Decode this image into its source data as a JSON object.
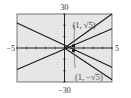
{
  "chart_data": {
    "type": "line",
    "title": "",
    "xlabel": "",
    "ylabel": "",
    "xlim": [
      -5,
      5
    ],
    "ylim": [
      -30,
      30
    ],
    "grid": false,
    "x_ticks_count": 10,
    "y_ticks_count": 6,
    "tick_labels": {
      "x_min": "−5",
      "x_max": "5",
      "y_max": "30",
      "y_min": "−30"
    },
    "series": [
      {
        "name": "line-1",
        "x": [
          -5,
          5
        ],
        "y": [
          22,
          -17
        ]
      },
      {
        "name": "line-2",
        "x": [
          -5,
          5
        ],
        "y": [
          -19,
          17
        ]
      },
      {
        "name": "line-3",
        "x": [
          0,
          5
        ],
        "y": [
          0,
          30
        ]
      },
      {
        "name": "line-4",
        "x": [
          0,
          5
        ],
        "y": [
          0,
          -28
        ]
      }
    ],
    "annotations": [
      {
        "text": "(1, √5)",
        "x": 1,
        "y": 2.236
      },
      {
        "text": "(1, −√5)",
        "x": 1,
        "y": -2.236
      }
    ]
  },
  "colors": {
    "plot_bg": "#e6e6e6",
    "frame": "#555555",
    "axis": "#222222",
    "line": "#1a1a1a",
    "text": "#333333"
  }
}
